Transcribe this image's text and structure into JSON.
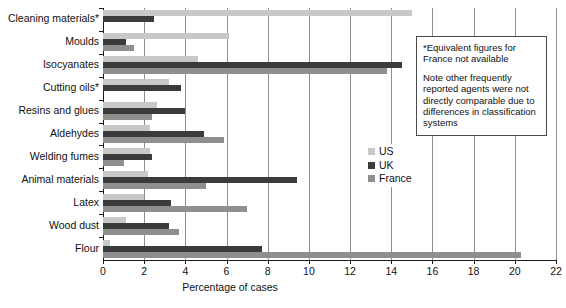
{
  "chart_data": {
    "type": "bar",
    "orientation": "horizontal",
    "title": "",
    "xlabel": "Percentage of cases",
    "ylabel": "",
    "xlim": [
      0,
      22
    ],
    "xticks": [
      0,
      2,
      4,
      6,
      8,
      10,
      12,
      14,
      16,
      18,
      20,
      22
    ],
    "grid": true,
    "grid_axis": "x",
    "legend_position": "right",
    "categories": [
      "Cleaning materials*",
      "Moulds",
      "Isocyanates",
      "Cutting oils*",
      "Resins and glues",
      "Aldehydes",
      "Welding fumes",
      "Animal materials",
      "Latex",
      "Wood dust",
      "Flour"
    ],
    "series": [
      {
        "name": "US",
        "color": "#c8c8c8",
        "values": [
          15.0,
          6.1,
          4.6,
          3.2,
          2.6,
          2.3,
          2.3,
          2.2,
          2.0,
          1.1,
          0.35
        ]
      },
      {
        "name": "UK",
        "color": "#3b3b3b",
        "values": [
          2.5,
          1.1,
          14.5,
          3.8,
          4.0,
          4.9,
          2.4,
          9.4,
          3.3,
          3.2,
          7.7
        ]
      },
      {
        "name": "France",
        "color": "#8f8f8f",
        "values": [
          null,
          1.5,
          13.8,
          null,
          2.4,
          5.9,
          1.0,
          5.0,
          7.0,
          3.7,
          20.3
        ]
      }
    ],
    "annotations": [
      "*Equivalent figures for France not available",
      "Note other frequently reported agents were not directly comparable due to differences in classification systems"
    ]
  },
  "note_box": {
    "paragraph_1": "*Equivalent figures for France not available",
    "paragraph_2": "Note other frequently reported agents were not directly comparable due to differences in classification systems"
  },
  "legend": {
    "items": [
      {
        "label": "US"
      },
      {
        "label": "UK"
      },
      {
        "label": "France"
      }
    ]
  },
  "axis": {
    "x_title": "Percentage of cases"
  }
}
